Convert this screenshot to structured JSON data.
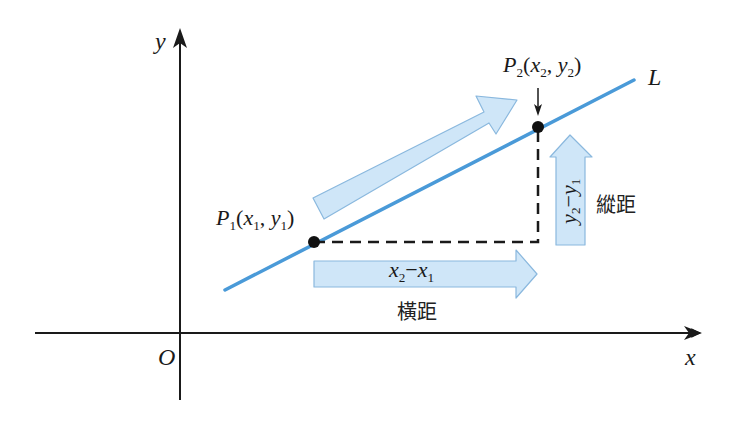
{
  "colors": {
    "line": "#4a9ad8",
    "arrow_fill": "#cfe6f8",
    "arrow_stroke": "#8ab8de",
    "axis": "#1a1a1a",
    "point": "#111111",
    "dash": "#1a1a1a"
  },
  "axes": {
    "x_label": "x",
    "y_label": "y",
    "origin_label": "O"
  },
  "line": {
    "label": "L",
    "start": [
      225,
      290
    ],
    "end": [
      634,
      80
    ]
  },
  "points": [
    {
      "name": "P1",
      "base": "P",
      "index": "1",
      "x_var": "x",
      "x_idx": "1",
      "y_var": "y",
      "y_idx": "1",
      "px": 314,
      "py": 242
    },
    {
      "name": "P2",
      "base": "P",
      "index": "2",
      "x_var": "x",
      "x_idx": "2",
      "y_var": "y",
      "y_idx": "2",
      "px": 538,
      "py": 127
    }
  ],
  "horizontal": {
    "expr_a": "x",
    "expr_a_idx": "2",
    "minus": "−",
    "expr_b": "x",
    "expr_b_idx": "1",
    "caption": "橫距"
  },
  "vertical": {
    "expr_a": "y",
    "expr_a_idx": "2",
    "minus": "−",
    "expr_b": "y",
    "expr_b_idx": "1",
    "caption": "縱距"
  },
  "punct": {
    "open": "(",
    "comma": ", ",
    "close": ")"
  }
}
